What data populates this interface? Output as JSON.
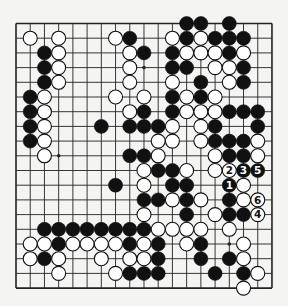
{
  "board": {
    "size": 19,
    "origin": {
      "x": 16,
      "y": 23.5
    },
    "spacing": {
      "x": 14.22,
      "y": 14.7
    },
    "line_color": "#222222",
    "background": "#f4f4f2",
    "star_points": [
      [
        3,
        3
      ],
      [
        3,
        9
      ],
      [
        3,
        15
      ],
      [
        9,
        3
      ],
      [
        9,
        9
      ],
      [
        9,
        15
      ],
      [
        15,
        3
      ],
      [
        15,
        9
      ],
      [
        15,
        15
      ]
    ],
    "stone_radius": 7
  },
  "stones": [
    {
      "r": 0,
      "c": 12,
      "color": "B"
    },
    {
      "r": 0,
      "c": 13,
      "color": "B"
    },
    {
      "r": 0,
      "c": 15,
      "color": "B"
    },
    {
      "r": 1,
      "c": 1,
      "color": "W"
    },
    {
      "r": 1,
      "c": 3,
      "color": "W"
    },
    {
      "r": 1,
      "c": 7,
      "color": "W"
    },
    {
      "r": 1,
      "c": 8,
      "color": "B"
    },
    {
      "r": 1,
      "c": 11,
      "color": "W"
    },
    {
      "r": 1,
      "c": 12,
      "color": "B"
    },
    {
      "r": 1,
      "c": 13,
      "color": "W"
    },
    {
      "r": 1,
      "c": 14,
      "color": "B"
    },
    {
      "r": 1,
      "c": 15,
      "color": "B"
    },
    {
      "r": 1,
      "c": 16,
      "color": "B"
    },
    {
      "r": 2,
      "c": 2,
      "color": "B"
    },
    {
      "r": 2,
      "c": 3,
      "color": "W"
    },
    {
      "r": 2,
      "c": 8,
      "color": "W"
    },
    {
      "r": 2,
      "c": 9,
      "color": "B"
    },
    {
      "r": 2,
      "c": 11,
      "color": "B"
    },
    {
      "r": 2,
      "c": 12,
      "color": "W"
    },
    {
      "r": 2,
      "c": 13,
      "color": "W"
    },
    {
      "r": 2,
      "c": 14,
      "color": "W"
    },
    {
      "r": 2,
      "c": 15,
      "color": "B"
    },
    {
      "r": 2,
      "c": 16,
      "color": "W"
    },
    {
      "r": 3,
      "c": 2,
      "color": "B"
    },
    {
      "r": 3,
      "c": 3,
      "color": "W"
    },
    {
      "r": 3,
      "c": 8,
      "color": "W"
    },
    {
      "r": 3,
      "c": 11,
      "color": "B"
    },
    {
      "r": 3,
      "c": 12,
      "color": "B"
    },
    {
      "r": 3,
      "c": 14,
      "color": "W"
    },
    {
      "r": 3,
      "c": 15,
      "color": "W"
    },
    {
      "r": 3,
      "c": 16,
      "color": "B"
    },
    {
      "r": 4,
      "c": 2,
      "color": "B"
    },
    {
      "r": 4,
      "c": 3,
      "color": "W"
    },
    {
      "r": 4,
      "c": 8,
      "color": "W"
    },
    {
      "r": 4,
      "c": 11,
      "color": "W"
    },
    {
      "r": 4,
      "c": 13,
      "color": "B"
    },
    {
      "r": 4,
      "c": 15,
      "color": "W"
    },
    {
      "r": 4,
      "c": 16,
      "color": "B"
    },
    {
      "r": 5,
      "c": 1,
      "color": "B"
    },
    {
      "r": 5,
      "c": 2,
      "color": "W"
    },
    {
      "r": 5,
      "c": 7,
      "color": "W"
    },
    {
      "r": 5,
      "c": 9,
      "color": "W"
    },
    {
      "r": 5,
      "c": 11,
      "color": "B"
    },
    {
      "r": 5,
      "c": 12,
      "color": "W"
    },
    {
      "r": 5,
      "c": 13,
      "color": "B"
    },
    {
      "r": 5,
      "c": 14,
      "color": "W"
    },
    {
      "r": 6,
      "c": 1,
      "color": "B"
    },
    {
      "r": 6,
      "c": 2,
      "color": "W"
    },
    {
      "r": 6,
      "c": 8,
      "color": "W"
    },
    {
      "r": 6,
      "c": 9,
      "color": "B"
    },
    {
      "r": 6,
      "c": 11,
      "color": "B"
    },
    {
      "r": 6,
      "c": 12,
      "color": "W"
    },
    {
      "r": 6,
      "c": 13,
      "color": "W"
    },
    {
      "r": 6,
      "c": 14,
      "color": "W"
    },
    {
      "r": 6,
      "c": 15,
      "color": "B"
    },
    {
      "r": 6,
      "c": 16,
      "color": "B"
    },
    {
      "r": 6,
      "c": 17,
      "color": "B"
    },
    {
      "r": 7,
      "c": 1,
      "color": "B"
    },
    {
      "r": 7,
      "c": 2,
      "color": "W"
    },
    {
      "r": 7,
      "c": 6,
      "color": "B"
    },
    {
      "r": 7,
      "c": 8,
      "color": "B"
    },
    {
      "r": 7,
      "c": 9,
      "color": "B"
    },
    {
      "r": 7,
      "c": 10,
      "color": "B"
    },
    {
      "r": 7,
      "c": 11,
      "color": "W"
    },
    {
      "r": 7,
      "c": 13,
      "color": "W"
    },
    {
      "r": 7,
      "c": 14,
      "color": "B"
    },
    {
      "r": 7,
      "c": 17,
      "color": "B"
    },
    {
      "r": 8,
      "c": 1,
      "color": "B"
    },
    {
      "r": 8,
      "c": 2,
      "color": "W"
    },
    {
      "r": 8,
      "c": 10,
      "color": "W"
    },
    {
      "r": 8,
      "c": 11,
      "color": "W"
    },
    {
      "r": 8,
      "c": 13,
      "color": "W"
    },
    {
      "r": 8,
      "c": 14,
      "color": "B"
    },
    {
      "r": 8,
      "c": 15,
      "color": "B"
    },
    {
      "r": 8,
      "c": 16,
      "color": "B"
    },
    {
      "r": 8,
      "c": 17,
      "color": "W"
    },
    {
      "r": 9,
      "c": 2,
      "color": "W"
    },
    {
      "r": 9,
      "c": 8,
      "color": "B"
    },
    {
      "r": 9,
      "c": 9,
      "color": "B"
    },
    {
      "r": 9,
      "c": 10,
      "color": "W"
    },
    {
      "r": 9,
      "c": 14,
      "color": "W"
    },
    {
      "r": 9,
      "c": 15,
      "color": "B"
    },
    {
      "r": 9,
      "c": 16,
      "color": "B"
    },
    {
      "r": 9,
      "c": 17,
      "color": "W"
    },
    {
      "r": 10,
      "c": 9,
      "color": "W"
    },
    {
      "r": 10,
      "c": 10,
      "color": "B"
    },
    {
      "r": 10,
      "c": 11,
      "color": "B"
    },
    {
      "r": 10,
      "c": 12,
      "color": "W"
    },
    {
      "r": 10,
      "c": 14,
      "color": "W"
    },
    {
      "r": 10,
      "c": 15,
      "color": "W",
      "label": "2"
    },
    {
      "r": 10,
      "c": 16,
      "color": "B",
      "label": "3"
    },
    {
      "r": 10,
      "c": 17,
      "color": "B",
      "label": "5"
    },
    {
      "r": 11,
      "c": 7,
      "color": "B"
    },
    {
      "r": 11,
      "c": 9,
      "color": "W"
    },
    {
      "r": 11,
      "c": 11,
      "color": "B"
    },
    {
      "r": 11,
      "c": 12,
      "color": "B"
    },
    {
      "r": 11,
      "c": 15,
      "color": "B",
      "label": "1"
    },
    {
      "r": 11,
      "c": 16,
      "color": "W"
    },
    {
      "r": 12,
      "c": 9,
      "color": "B"
    },
    {
      "r": 12,
      "c": 10,
      "color": "B"
    },
    {
      "r": 12,
      "c": 11,
      "color": "W"
    },
    {
      "r": 12,
      "c": 12,
      "color": "B"
    },
    {
      "r": 12,
      "c": 13,
      "color": "W"
    },
    {
      "r": 12,
      "c": 15,
      "color": "B"
    },
    {
      "r": 12,
      "c": 16,
      "color": "W"
    },
    {
      "r": 12,
      "c": 17,
      "color": "W",
      "label": "6"
    },
    {
      "r": 13,
      "c": 9,
      "color": "W"
    },
    {
      "r": 13,
      "c": 12,
      "color": "B"
    },
    {
      "r": 13,
      "c": 14,
      "color": "W"
    },
    {
      "r": 13,
      "c": 15,
      "color": "B"
    },
    {
      "r": 13,
      "c": 16,
      "color": "B"
    },
    {
      "r": 13,
      "c": 17,
      "color": "W",
      "label": "4"
    },
    {
      "r": 14,
      "c": 2,
      "color": "B"
    },
    {
      "r": 14,
      "c": 3,
      "color": "B"
    },
    {
      "r": 14,
      "c": 4,
      "color": "B"
    },
    {
      "r": 14,
      "c": 5,
      "color": "B"
    },
    {
      "r": 14,
      "c": 6,
      "color": "B"
    },
    {
      "r": 14,
      "c": 7,
      "color": "B"
    },
    {
      "r": 14,
      "c": 8,
      "color": "B"
    },
    {
      "r": 14,
      "c": 9,
      "color": "B"
    },
    {
      "r": 14,
      "c": 10,
      "color": "W"
    },
    {
      "r": 14,
      "c": 11,
      "color": "W"
    },
    {
      "r": 14,
      "c": 12,
      "color": "W"
    },
    {
      "r": 14,
      "c": 13,
      "color": "W"
    },
    {
      "r": 14,
      "c": 15,
      "color": "W"
    },
    {
      "r": 15,
      "c": 1,
      "color": "W"
    },
    {
      "r": 15,
      "c": 2,
      "color": "W"
    },
    {
      "r": 15,
      "c": 3,
      "color": "B"
    },
    {
      "r": 15,
      "c": 4,
      "color": "W"
    },
    {
      "r": 15,
      "c": 5,
      "color": "W"
    },
    {
      "r": 15,
      "c": 6,
      "color": "W"
    },
    {
      "r": 15,
      "c": 7,
      "color": "W"
    },
    {
      "r": 15,
      "c": 8,
      "color": "B"
    },
    {
      "r": 15,
      "c": 9,
      "color": "W"
    },
    {
      "r": 15,
      "c": 10,
      "color": "B"
    },
    {
      "r": 15,
      "c": 12,
      "color": "W"
    },
    {
      "r": 15,
      "c": 13,
      "color": "B"
    },
    {
      "r": 15,
      "c": 16,
      "color": "W"
    },
    {
      "r": 16,
      "c": 1,
      "color": "W"
    },
    {
      "r": 16,
      "c": 2,
      "color": "B"
    },
    {
      "r": 16,
      "c": 3,
      "color": "W"
    },
    {
      "r": 16,
      "c": 6,
      "color": "W"
    },
    {
      "r": 16,
      "c": 8,
      "color": "W"
    },
    {
      "r": 16,
      "c": 9,
      "color": "W"
    },
    {
      "r": 16,
      "c": 10,
      "color": "B"
    },
    {
      "r": 16,
      "c": 13,
      "color": "B"
    },
    {
      "r": 16,
      "c": 15,
      "color": "B"
    },
    {
      "r": 16,
      "c": 16,
      "color": "W"
    },
    {
      "r": 17,
      "c": 3,
      "color": "W"
    },
    {
      "r": 17,
      "c": 7,
      "color": "W"
    },
    {
      "r": 17,
      "c": 8,
      "color": "B"
    },
    {
      "r": 17,
      "c": 9,
      "color": "B"
    },
    {
      "r": 17,
      "c": 10,
      "color": "B"
    },
    {
      "r": 17,
      "c": 14,
      "color": "B"
    },
    {
      "r": 17,
      "c": 16,
      "color": "B"
    },
    {
      "r": 17,
      "c": 17,
      "color": "W"
    },
    {
      "r": 18,
      "c": 16,
      "color": "W"
    }
  ],
  "move_labels": [
    {
      "number": "1",
      "color": "B",
      "r": 11,
      "c": 15
    },
    {
      "number": "2",
      "color": "W",
      "r": 10,
      "c": 15
    },
    {
      "number": "3",
      "color": "B",
      "r": 10,
      "c": 16
    },
    {
      "number": "4",
      "color": "W",
      "r": 13,
      "c": 17
    },
    {
      "number": "5",
      "color": "B",
      "r": 10,
      "c": 17
    },
    {
      "number": "6",
      "color": "W",
      "r": 12,
      "c": 17
    }
  ]
}
